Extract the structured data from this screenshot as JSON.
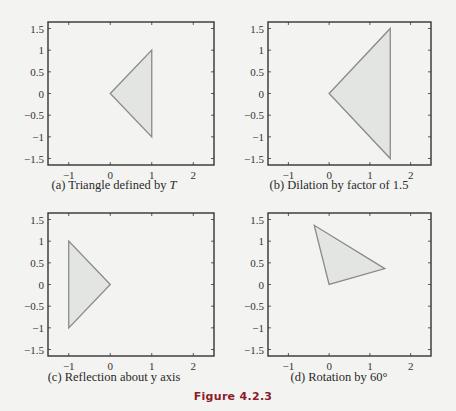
{
  "figure_title": "Figure 4.2.3",
  "colors": {
    "background": "#f3f3f1",
    "triangle_fill": "#e3e5e3",
    "triangle_stroke": "#8a8a8a",
    "axes": "#333333",
    "figure_title": "#8a1c2b"
  },
  "panels": [
    {
      "caption_prefix": "(a) Triangle defined by ",
      "caption_italic": "T"
    },
    {
      "caption_prefix": "(b) Dilation by factor of 1.5",
      "caption_italic": ""
    },
    {
      "caption_prefix": "(c) Reflection about y axis",
      "caption_italic": ""
    },
    {
      "caption_prefix": "(d) Rotation by 60°",
      "caption_italic": ""
    }
  ],
  "chart_data": [
    {
      "type": "line",
      "title": "(a) Triangle defined by T",
      "xlim": [
        -1.5,
        2.5
      ],
      "ylim": [
        -1.65,
        1.65
      ],
      "xticks": [
        -1,
        0,
        1,
        2
      ],
      "yticks": [
        1.5,
        1,
        0.5,
        0,
        -0.5,
        -1,
        -1.5
      ],
      "polygon": [
        [
          0,
          0
        ],
        [
          1,
          1
        ],
        [
          1,
          -1
        ]
      ],
      "grid": false
    },
    {
      "type": "line",
      "title": "(b) Dilation by factor of 1.5",
      "xlim": [
        -1.5,
        2.5
      ],
      "ylim": [
        -1.65,
        1.65
      ],
      "xticks": [
        -1,
        0,
        1,
        2
      ],
      "yticks": [
        1.5,
        1,
        0.5,
        0,
        -0.5,
        -1,
        -1.5
      ],
      "polygon": [
        [
          0,
          0
        ],
        [
          1.5,
          1.5
        ],
        [
          1.5,
          -1.5
        ]
      ],
      "grid": false
    },
    {
      "type": "line",
      "title": "(c) Reflection about y axis",
      "xlim": [
        -1.5,
        2.5
      ],
      "ylim": [
        -1.65,
        1.65
      ],
      "xticks": [
        -1,
        0,
        1,
        2
      ],
      "yticks": [
        1.5,
        1,
        0.5,
        0,
        -0.5,
        -1,
        -1.5
      ],
      "polygon": [
        [
          0,
          0
        ],
        [
          -1,
          1
        ],
        [
          -1,
          -1
        ]
      ],
      "grid": false
    },
    {
      "type": "line",
      "title": "(d) Rotation by 60°",
      "xlim": [
        -1.5,
        2.5
      ],
      "ylim": [
        -1.65,
        1.65
      ],
      "xticks": [
        -1,
        0,
        1,
        2
      ],
      "yticks": [
        1.5,
        1,
        0.5,
        0,
        -0.5,
        -1,
        -1.5
      ],
      "polygon": [
        [
          0,
          0
        ],
        [
          -0.366,
          1.366
        ],
        [
          1.366,
          0.366
        ]
      ],
      "grid": false
    }
  ]
}
